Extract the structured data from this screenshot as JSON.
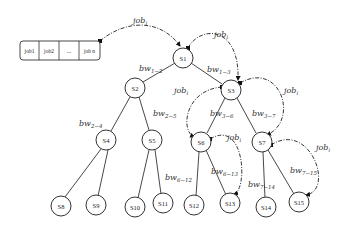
{
  "diagram": {
    "type": "binary tree with job flow",
    "queue": {
      "cells": [
        "job1",
        "job2",
        "...",
        "job n"
      ]
    },
    "flow_label": {
      "base": "job",
      "subscript": "i"
    },
    "nodes": [
      {
        "id": "S1",
        "label": "S1"
      },
      {
        "id": "S2",
        "label": "S2"
      },
      {
        "id": "S3",
        "label": "S3"
      },
      {
        "id": "S4",
        "label": "S4"
      },
      {
        "id": "S5",
        "label": "S5"
      },
      {
        "id": "S6",
        "label": "S6"
      },
      {
        "id": "S7",
        "label": "S7"
      },
      {
        "id": "S8",
        "label": "S8"
      },
      {
        "id": "S9",
        "label": "S9"
      },
      {
        "id": "S10",
        "label": "S10"
      },
      {
        "id": "S11",
        "label": "S11"
      },
      {
        "id": "S12",
        "label": "S12"
      },
      {
        "id": "S13",
        "label": "S13"
      },
      {
        "id": "S14",
        "label": "S14"
      },
      {
        "id": "S15",
        "label": "S15"
      }
    ],
    "edge_labels": {
      "bw_1_2": {
        "base": "bw",
        "sub": "1−2"
      },
      "bw_1_3": {
        "base": "bw",
        "sub": "1−3"
      },
      "bw_2_4": {
        "base": "bw",
        "sub": "2−4"
      },
      "bw_2_5": {
        "base": "bw",
        "sub": "2−5"
      },
      "bw_3_6": {
        "base": "bw",
        "sub": "3−6"
      },
      "bw_3_7": {
        "base": "bw",
        "sub": "3−7"
      },
      "bw_6_12": {
        "base": "bw",
        "sub": "6−12"
      },
      "bw_6_13": {
        "base": "bw",
        "sub": "6−13"
      },
      "bw_7_14": {
        "base": "bw",
        "sub": "7−14"
      },
      "bw_7_15": {
        "base": "bw",
        "sub": "7−15"
      }
    }
  }
}
